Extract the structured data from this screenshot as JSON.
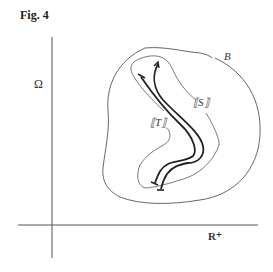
{
  "figure": {
    "title": "Fig. 4",
    "labels": {
      "y_axis": "Ω",
      "x_axis": "R⁺",
      "outer_region": "B",
      "inner_region": "⟦S⟧",
      "trajectory": "⟦T⟧"
    },
    "colors": {
      "line": "#444444",
      "thick_line": "#222222",
      "background": "#ffffff"
    }
  }
}
